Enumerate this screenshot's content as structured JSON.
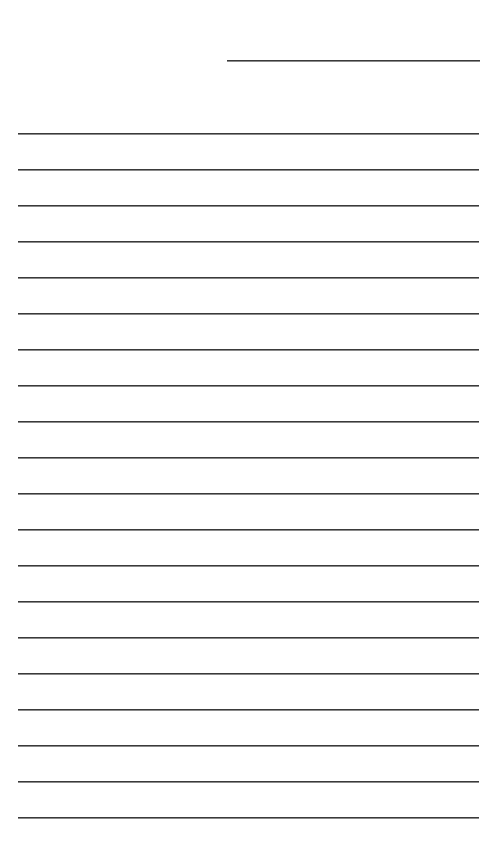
{
  "document": {
    "type": "lined-paper",
    "header_line": {
      "x": 227,
      "y": 60,
      "width": 253
    },
    "rules": {
      "count": 20,
      "start_y": 133,
      "spacing": 36,
      "x": 18,
      "width": 461
    },
    "line_color": "#3a3a3a",
    "background": "#ffffff"
  }
}
